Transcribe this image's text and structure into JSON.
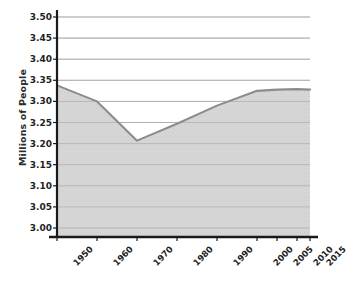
{
  "chart_data": {
    "type": "area",
    "title": "",
    "xlabel": "",
    "ylabel": "Millions of People",
    "categories": [
      "1950",
      "1960",
      "1970",
      "1980",
      "1990",
      "2000",
      "2005",
      "2010",
      "2015"
    ],
    "x": [
      1950,
      1960,
      1970,
      1980,
      1990,
      2000,
      2005,
      2010,
      2015
    ],
    "values": [
      3.338,
      3.3,
      3.207,
      3.247,
      3.29,
      3.325,
      3.328,
      3.329,
      3.328
    ],
    "series": [
      {
        "name": "Millions of People",
        "values": [
          3.338,
          3.3,
          3.207,
          3.247,
          3.29,
          3.325,
          3.328,
          3.329,
          3.328
        ]
      }
    ],
    "ylim": [
      3.0,
      3.5
    ],
    "ytick_labels": [
      "3.50",
      "3.45",
      "3.40",
      "3.35",
      "3.30",
      "3.25",
      "3.20",
      "3.15",
      "3.10",
      "3.05",
      "3.00"
    ],
    "ytick_values": [
      3.5,
      3.45,
      3.4,
      3.35,
      3.3,
      3.25,
      3.2,
      3.15,
      3.1,
      3.05,
      3.0
    ],
    "ytick_step": 0.05,
    "grid": true,
    "grid_axis": "y",
    "legend": false,
    "legend_position": "none",
    "xtick_rotation": -45,
    "colors": {
      "area_fill": "#d6d6d6",
      "line": "#8c8c8c",
      "grid": "#b8b8b8",
      "axis": "#1a1a1a",
      "background": "#ffffff",
      "text": "#1f1f1f"
    }
  },
  "geometry": {
    "plot_left": 57,
    "plot_right": 310,
    "plot_top": 17,
    "axis_baseline": 237,
    "y_top_value": 3.5,
    "y_bottom_value": 3.0,
    "y_top_px": 17,
    "y_bottom_px": 228,
    "xticks_px": [
      57,
      97,
      137,
      177,
      217,
      257,
      277,
      297,
      310
    ]
  }
}
